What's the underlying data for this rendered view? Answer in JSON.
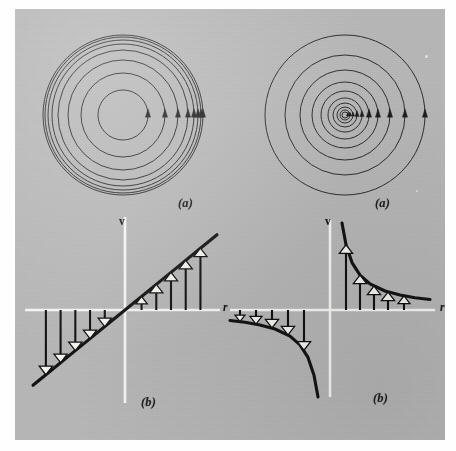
{
  "figure": {
    "kind": "scientific-figure",
    "background_plate_color": "#b9b9b9",
    "ink_color": "#1a1a1a",
    "axis_color": "#f4f4f2",
    "arrowhead_fill": "#f2f2ee",
    "panels": [
      {
        "id": "top-left",
        "caption": "(a)",
        "subject": "streamlines-solid-body-rotation",
        "description": "concentric circular streamlines, spacing decreasing outward"
      },
      {
        "id": "top-right",
        "caption": "(a)",
        "subject": "streamlines-irrotational-vortex",
        "description": "concentric circular streamlines, spacing increasing outward"
      },
      {
        "id": "bottom-left",
        "caption": "(b)",
        "subject": "velocity-profile-linear",
        "axis_labels": {
          "y": "v",
          "x": "r"
        }
      },
      {
        "id": "bottom-right",
        "caption": "(b)",
        "subject": "velocity-profile-hyperbolic",
        "axis_labels": {
          "y": "v",
          "x": "r"
        }
      }
    ]
  },
  "chart_data": [
    {
      "id": "top-left-streamlines",
      "type": "line",
      "title": "(a)",
      "xlabel": "",
      "ylabel": "",
      "annotations": [
        "solid body rotation",
        "v proportional to r"
      ],
      "center": [
        123,
        106
      ],
      "radii": [
        25,
        42,
        55,
        65,
        71,
        75,
        78,
        80
      ],
      "arrow_angle_deg": 0,
      "grid": false,
      "legend": false
    },
    {
      "id": "top-right-streamlines",
      "type": "line",
      "title": "(a)",
      "xlabel": "",
      "ylabel": "",
      "annotations": [
        "irrotational (free) vortex",
        "v proportional to 1/r"
      ],
      "center": [
        330,
        106
      ],
      "radii": [
        3,
        5,
        8,
        12,
        17,
        24,
        33,
        45,
        60,
        80
      ],
      "arrow_angle_deg": 0,
      "grid": false,
      "legend": false
    },
    {
      "id": "bottom-left-velocity-profile",
      "type": "line",
      "title": "(b)",
      "xlabel": "r",
      "ylabel": "v",
      "equation": "v = omega * r",
      "xlim": [
        -1.0,
        1.0
      ],
      "ylim": [
        -0.42,
        0.42
      ],
      "x": [
        -1.0,
        -0.8,
        -0.6,
        -0.4,
        -0.2,
        0.0,
        0.2,
        0.4,
        0.6,
        0.8,
        1.0
      ],
      "values": [
        -0.38,
        -0.304,
        -0.228,
        -0.152,
        -0.076,
        0.0,
        0.076,
        0.152,
        0.228,
        0.304,
        0.38
      ],
      "arrow_x": [
        -0.86,
        -0.7,
        -0.54,
        -0.38,
        -0.22,
        0.18,
        0.34,
        0.5,
        0.66,
        0.82
      ],
      "arrow_v": [
        -0.327,
        -0.266,
        -0.205,
        -0.144,
        -0.084,
        0.068,
        0.129,
        0.19,
        0.251,
        0.312
      ],
      "grid": false,
      "legend": false
    },
    {
      "id": "bottom-right-velocity-profile",
      "type": "line",
      "title": "(b)",
      "xlabel": "r",
      "ylabel": "v",
      "equation": "v = C / r",
      "xlim": [
        -1.0,
        1.0
      ],
      "ylim": [
        -0.95,
        0.95
      ],
      "x": [
        -1.0,
        -0.85,
        -0.7,
        -0.55,
        -0.4,
        -0.3,
        -0.22,
        -0.16,
        -0.12,
        0.12,
        0.16,
        0.22,
        0.3,
        0.4,
        0.55,
        0.7,
        0.85,
        1.0
      ],
      "values": [
        -0.072,
        -0.085,
        -0.103,
        -0.131,
        -0.18,
        -0.24,
        -0.327,
        -0.45,
        -0.6,
        0.6,
        0.45,
        0.327,
        0.24,
        0.18,
        0.131,
        0.103,
        0.085,
        0.072
      ],
      "arrow_x": [
        -0.9,
        -0.74,
        -0.58,
        -0.42,
        -0.26,
        0.16,
        0.3,
        0.44,
        0.58,
        0.74
      ],
      "arrow_v": [
        -0.08,
        -0.097,
        -0.124,
        -0.171,
        -0.277,
        0.45,
        0.24,
        0.164,
        0.124,
        0.097
      ],
      "grid": false,
      "legend": false
    }
  ],
  "labels": {
    "caption_a_left": "(a)",
    "caption_a_right": "(a)",
    "caption_b_left": "(b)",
    "caption_b_right": "(b)",
    "v_left": "v",
    "r_left": "r",
    "v_right": "v",
    "r_right": "r"
  }
}
